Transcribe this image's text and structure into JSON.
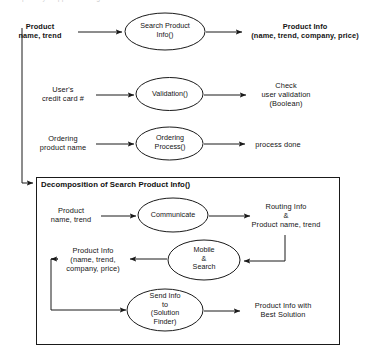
{
  "page": {
    "top_cropped_text": "partially cropped heading line",
    "background_color": "#ffffff",
    "line_color": "#1a1a1a"
  },
  "level0": {
    "rows": [
      {
        "input_label": [
          "Product",
          "name, trend"
        ],
        "process": [
          "Search Product",
          "Info()"
        ],
        "output_label": [
          "Product Info",
          "(name, trend, company, price)"
        ]
      },
      {
        "input_label": [
          "User's",
          "credit card #"
        ],
        "process": [
          "Validation()"
        ],
        "output_label": [
          "Check",
          "user validation",
          "(Boolean)"
        ]
      },
      {
        "input_label": [
          "Ordering",
          "product name"
        ],
        "process": [
          "Ordering",
          "Process()"
        ],
        "output_label": [
          "process done"
        ]
      }
    ]
  },
  "decomposition": {
    "title": "Decomposition of Search Product Info()",
    "rows": [
      {
        "input_label": [
          "Product",
          "name, trend"
        ],
        "process": [
          "Communicate"
        ],
        "output_label": [
          "Routing Info",
          "&",
          "Product name, trend"
        ]
      },
      {
        "output_label": [
          "Product Info",
          "(name, trend,",
          "company, price)"
        ],
        "process": [
          "Mobile",
          "&",
          "Search"
        ]
      },
      {
        "process": [
          "Send Info",
          "to",
          "(Solution",
          "Finder)"
        ],
        "output_label": [
          "Product Info with",
          "Best Solution"
        ]
      }
    ]
  },
  "icons": {
    "arrow": "arrowhead-icon",
    "ellipse": "process-ellipse-icon"
  }
}
